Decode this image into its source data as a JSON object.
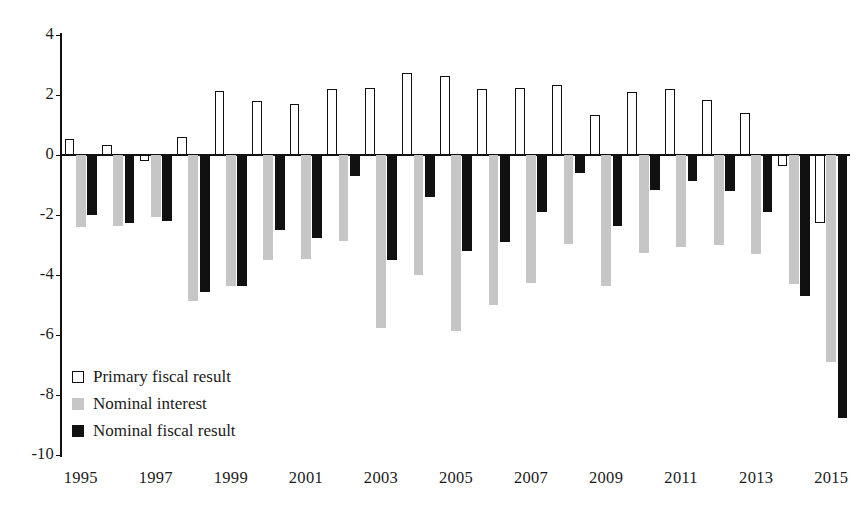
{
  "chart_data": {
    "type": "bar",
    "title": "",
    "subtitle": "",
    "xlabel": "",
    "ylabel": "",
    "ylim": [
      -10,
      4
    ],
    "yticks": [
      4,
      2,
      0,
      -2,
      -4,
      -6,
      -8,
      -10
    ],
    "ytick_labels": [
      "4",
      "2",
      "0",
      "-2",
      "-4",
      "-6",
      "-8",
      "-10"
    ],
    "grid": false,
    "legend_position": "lower-left",
    "categories": [
      "1995",
      "1996",
      "1997",
      "1998",
      "1999",
      "2000",
      "2001",
      "2002",
      "2003",
      "2004",
      "2005",
      "2006",
      "2007",
      "2008",
      "2009",
      "2010",
      "2011",
      "2012",
      "2013",
      "2014",
      "2015"
    ],
    "xtick_labels": [
      "1995",
      "1997",
      "1999",
      "2001",
      "2003",
      "2005",
      "2007",
      "2009",
      "2011",
      "2013",
      "2015"
    ],
    "series": [
      {
        "name": "Primary fiscal result",
        "color": "#ffffff",
        "edge_color": "#111111",
        "values": [
          0.55,
          0.35,
          -0.2,
          0.6,
          2.15,
          1.8,
          1.7,
          2.2,
          2.25,
          2.75,
          2.65,
          2.2,
          2.25,
          2.35,
          1.35,
          2.1,
          2.2,
          1.85,
          1.4,
          -0.35,
          -2.25
        ]
      },
      {
        "name": "Nominal interest",
        "color": "#c6c6c6",
        "edge_color": "#c6c6c6",
        "values": [
          -2.4,
          -2.35,
          -2.05,
          -4.85,
          -4.35,
          -3.5,
          -3.45,
          -2.85,
          -5.75,
          -4.0,
          -5.85,
          -5.0,
          -4.25,
          -2.95,
          -4.35,
          -3.25,
          -3.05,
          -3.0,
          -3.3,
          -4.3,
          -6.9
        ]
      },
      {
        "name": "Nominal fiscal result",
        "color": "#111111",
        "edge_color": "#111111",
        "values": [
          -2.0,
          -2.25,
          -2.2,
          -4.55,
          -4.35,
          -2.5,
          -2.75,
          -0.7,
          -3.5,
          -1.4,
          -3.2,
          -2.9,
          -1.9,
          -0.6,
          -2.35,
          -1.15,
          -0.85,
          -1.2,
          -1.9,
          -4.7,
          -8.75
        ]
      }
    ]
  },
  "legend": {
    "items": [
      {
        "label": "Primary fiscal result",
        "swatch": "primary"
      },
      {
        "label": "Nominal interest",
        "swatch": "interest"
      },
      {
        "label": "Nominal fiscal result",
        "swatch": "nominal"
      }
    ]
  }
}
